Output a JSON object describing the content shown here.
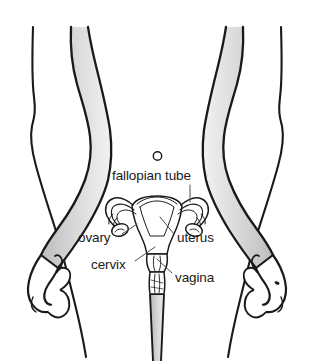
{
  "image": {
    "kind": "anatomical-illustration",
    "subject": "female reproductive system in body outline",
    "background_color": "#ffffff",
    "line_color": "#1a1a1a",
    "shade_color": "#d9d9d9",
    "width": 314,
    "height": 361
  },
  "labels": {
    "fallopian_tube": "fallopian tube",
    "ovary": "ovary",
    "cervix": "cervix",
    "uterus": "uterus",
    "vagina": "vagina"
  },
  "parts": {
    "navel": "navel",
    "left_arm": "left arm",
    "right_arm": "right arm",
    "left_hand": "left hand",
    "right_hand": "right hand",
    "torso": "torso outline",
    "left_leg": "left leg",
    "right_leg": "right leg",
    "uterus_body": "uterus",
    "left_fallopian_tube": "left fallopian tube",
    "right_fallopian_tube": "right fallopian tube",
    "left_ovary": "left ovary",
    "right_ovary": "right ovary",
    "cervix_part": "cervix",
    "vaginal_canal": "vaginal canal"
  }
}
